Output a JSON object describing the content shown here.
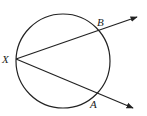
{
  "diagram": {
    "type": "geometry",
    "circle": {
      "cx": 63,
      "cy": 61,
      "r": 47
    },
    "points": [
      {
        "label": "X",
        "x": 16,
        "y": 59
      },
      {
        "label": "B",
        "x": 97,
        "y": 31
      },
      {
        "label": "A",
        "x": 95,
        "y": 92
      }
    ],
    "rays": [
      {
        "from": "X",
        "through": "B",
        "end": [
          138,
          17
        ]
      },
      {
        "from": "X",
        "through": "A",
        "end": [
          134,
          109
        ]
      }
    ],
    "labels": {
      "x": "X",
      "b": "B",
      "a": "A"
    },
    "stroke_color": "#222222"
  }
}
